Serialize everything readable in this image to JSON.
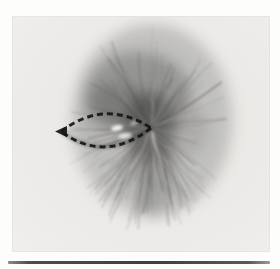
{
  "figure": {
    "kind": "grayscale-micrograph",
    "canvas": {
      "width": 280,
      "height": 269
    },
    "colors": {
      "page_bg": "#fdfdfc",
      "photo_inner": "#e7e6e3",
      "photo_outer": "#f0efed",
      "fiber_palette": [
        "#3f3f3e",
        "#555350",
        "#6b6967",
        "#787673"
      ],
      "light_fiber": "#f3f2ef",
      "haze": "#4a4a48",
      "outline_dash": "#161615",
      "highlight": "#ffffff",
      "rule_dark": "#3e3e3e"
    },
    "photo": {
      "x": 12,
      "y": 16,
      "width": 258,
      "height": 236
    },
    "aster": {
      "cx": 151,
      "cy": 128,
      "rx": 76,
      "ry": 94,
      "fiber_count": 160,
      "light_fiber_count": 36,
      "seed": 11
    },
    "haze_blobs": [
      {
        "cx": 152,
        "cy": 120,
        "rx": 80,
        "ry": 96,
        "color": "#5a5a58",
        "opacity": 0.28
      },
      {
        "cx": 138,
        "cy": 92,
        "rx": 52,
        "ry": 40,
        "color": "#454545",
        "opacity": 0.34
      },
      {
        "cx": 118,
        "cy": 106,
        "rx": 34,
        "ry": 22,
        "color": "#3e3e3e",
        "opacity": 0.28
      },
      {
        "cx": 150,
        "cy": 127,
        "rx": 26,
        "ry": 34,
        "color": "#323232",
        "opacity": 0.46
      },
      {
        "cx": 153,
        "cy": 170,
        "rx": 18,
        "ry": 46,
        "color": "#464646",
        "opacity": 0.26
      },
      {
        "cx": 168,
        "cy": 128,
        "rx": 40,
        "ry": 34,
        "color": "#565654",
        "opacity": 0.18
      }
    ],
    "outline": {
      "tip_x": 61,
      "tip_y": 131.5,
      "vertex_x": 151,
      "vertex_y": 128,
      "upper_cx": 105,
      "upper_cy": 98,
      "lower_cx": 105,
      "lower_cy": 164,
      "dash": "6 4",
      "stroke_width": 3,
      "arrowhead": "55,131.5 67,126 67,137",
      "interior_fill_opacity": 0.1,
      "inner_shadow_opacity": 0.3
    },
    "highlights": [
      {
        "cx": 117,
        "cy": 128,
        "rx": 6,
        "ry": 2.8,
        "rot": -12,
        "opacity": 0.9
      },
      {
        "cx": 125,
        "cy": 136,
        "rx": 7,
        "ry": 3,
        "rot": -8,
        "opacity": 0.72
      },
      {
        "cx": 134,
        "cy": 123,
        "rx": 4,
        "ry": 1.8,
        "rot": -22,
        "opacity": 0.55
      }
    ],
    "rule": {
      "x": 8,
      "y": 261,
      "width": 262,
      "height": 3
    }
  }
}
